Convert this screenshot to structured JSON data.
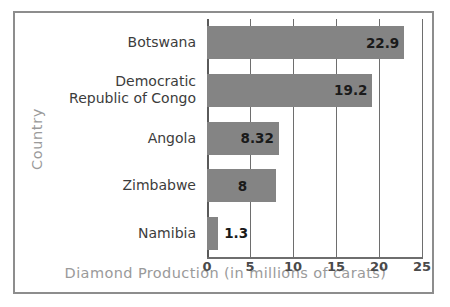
{
  "chart_data": {
    "type": "bar",
    "orientation": "horizontal",
    "title": "",
    "xlabel": "Diamond Production (in millions of carats)",
    "ylabel": "Country",
    "categories": [
      "Botswana",
      "Democratic\nRepublic of Congo",
      "Angola",
      "Zimbabwe",
      "Namibia"
    ],
    "values": [
      22.9,
      19.2,
      8.32,
      8,
      1.3
    ],
    "value_labels": [
      "22.9",
      "19.2",
      "8.32",
      "8",
      "1.3"
    ],
    "xlim": [
      0,
      25
    ],
    "xticks": [
      0,
      5,
      10,
      15,
      20,
      25
    ],
    "xtick_labels": [
      "0",
      "5",
      "10",
      "15",
      "20",
      "25"
    ],
    "grid": true,
    "legend": "none",
    "bar_color": "#848484",
    "axis_label_color": "#9a9a9a",
    "frame_color": "#8d8d8d"
  }
}
